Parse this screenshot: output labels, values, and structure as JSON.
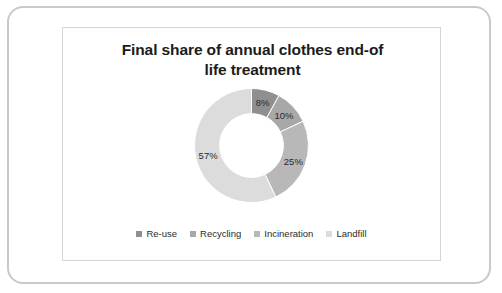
{
  "frame": {
    "outer_border_color": "#c9c9c9",
    "inner_border_color": "#d5d5d5",
    "background": "#ffffff"
  },
  "chart_data": {
    "type": "pie",
    "variant": "doughnut",
    "title": "Final share of annual clothes end-of life treatment",
    "title_line1": "Final share of annual clothes end-of",
    "title_line2": "life treatment",
    "xlabel": "",
    "ylabel": "",
    "grid": false,
    "legend_position": "bottom",
    "start_angle_deg": 0,
    "direction": "clockwise",
    "inner_radius_ratio": 0.56,
    "categories": [
      "Re-use",
      "Recycling",
      "Incineration",
      "Landfill"
    ],
    "values": [
      8,
      10,
      25,
      57
    ],
    "value_labels": [
      "8%",
      "10%",
      "25%",
      "57%"
    ],
    "colors": [
      "#8f8f8f",
      "#a8a8a8",
      "#b8b8b8",
      "#dcdcdc"
    ],
    "slices": [
      {
        "name": "Re-use",
        "value": 8,
        "label": "8%",
        "color": "#8f8f8f"
      },
      {
        "name": "Recycling",
        "value": 10,
        "label": "10%",
        "color": "#a8a8a8"
      },
      {
        "name": "Incineration",
        "value": 25,
        "label": "25%",
        "color": "#b8b8b8"
      },
      {
        "name": "Landfill",
        "value": 57,
        "label": "57%",
        "color": "#dcdcdc"
      }
    ]
  },
  "legend": {
    "items": [
      {
        "label": "Re-use",
        "color": "#8f8f8f"
      },
      {
        "label": "Recycling",
        "color": "#a8a8a8"
      },
      {
        "label": "Incineration",
        "color": "#b8b8b8"
      },
      {
        "label": "Landfill",
        "color": "#dcdcdc"
      }
    ]
  }
}
